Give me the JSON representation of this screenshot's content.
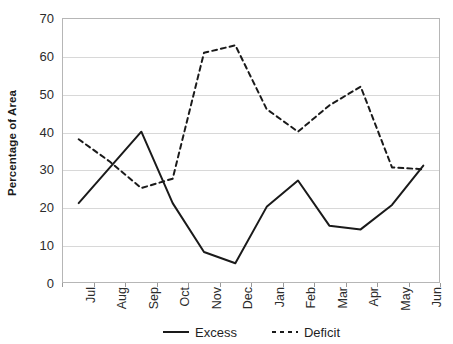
{
  "chart_data": {
    "type": "line",
    "title": "",
    "xlabel": "",
    "ylabel": "Percentage of Area",
    "ylim": [
      0,
      70
    ],
    "ytick_step": 10,
    "yticks": [
      0,
      10,
      20,
      30,
      40,
      50,
      60,
      70
    ],
    "ytick_labels": [
      "0",
      "10",
      "20",
      "30",
      "40",
      "50",
      "60",
      "70"
    ],
    "grid": true,
    "grid_axis": "y",
    "legend_position": "bottom",
    "categories": [
      "Jul",
      "Aug",
      "Sep",
      "Oct",
      "Nov",
      "Dec",
      "Jan",
      "Feb",
      "Mar",
      "Apr",
      "May",
      "Jun"
    ],
    "series": [
      {
        "name": "Excess",
        "style": "solid",
        "color": "#1a1a1a",
        "values": [
          21,
          30.5,
          40,
          21,
          8,
          5,
          20,
          27,
          15,
          14,
          20.5,
          31
        ]
      },
      {
        "name": "Deficit",
        "style": "dashed",
        "color": "#1a1a1a",
        "values": [
          38,
          32,
          25,
          27.5,
          61,
          63,
          46,
          40,
          47,
          52,
          30.5,
          30
        ]
      }
    ]
  },
  "legend": {
    "items": [
      {
        "label": "Excess",
        "style": "solid"
      },
      {
        "label": "Deficit",
        "style": "dashed"
      }
    ]
  },
  "colors": {
    "line": "#1a1a1a",
    "grid": "#d8d8d8",
    "frame": "#b6b6b6",
    "text": "#2b2b2b",
    "background": "#ffffff"
  }
}
